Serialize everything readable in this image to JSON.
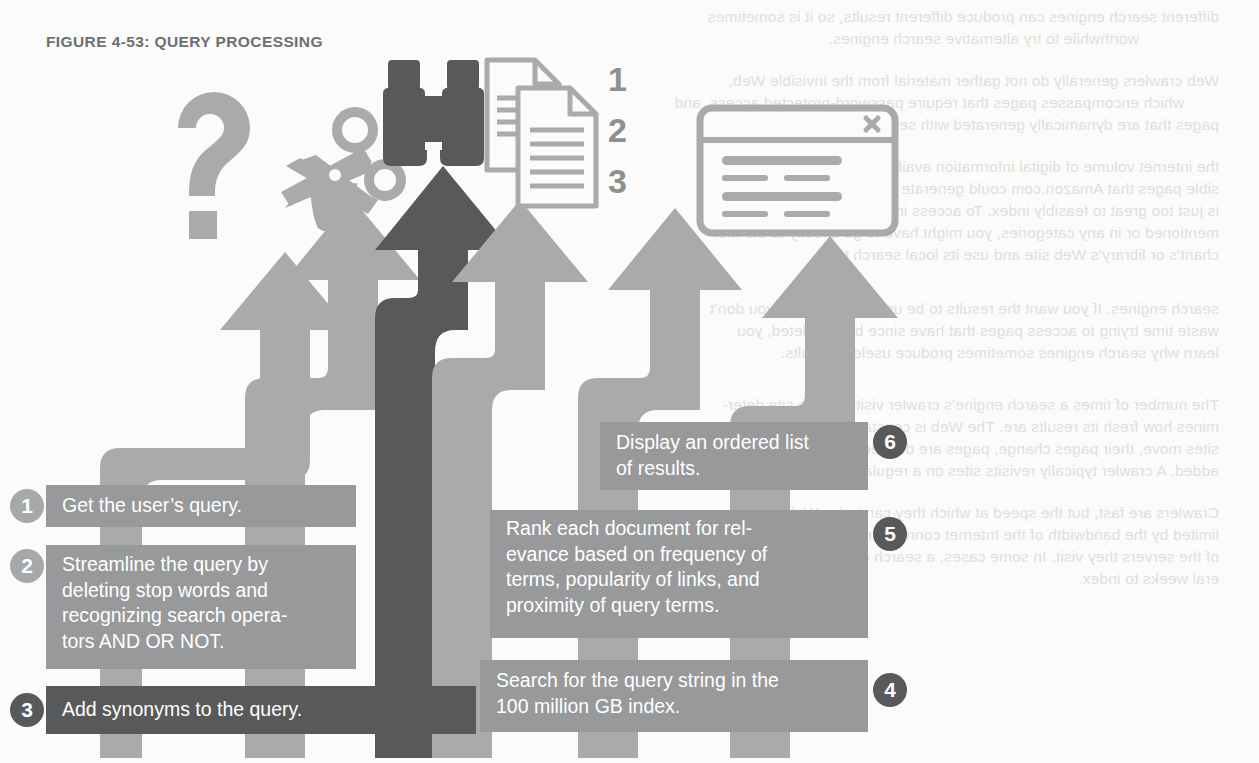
{
  "figure": {
    "title": "FIGURE 4-53: QUERY PROCESSING"
  },
  "colors": {
    "light_gray": "#a9aaac",
    "mid_gray": "#96989a",
    "dark_gray": "#58595b",
    "box_light": "#98999b",
    "box_dark": "#58595b",
    "circle_gray": "#a7a8aa",
    "circle_dark": "#58595b",
    "icon_light": "#a9aaac",
    "icon_dark": "#58595b",
    "text_white": "#ffffff",
    "title_gray": "#6d6f71",
    "page_bg": "#fbfbfa",
    "bleed_text": "#c9c9c7"
  },
  "icons": [
    {
      "name": "question-mark-icon",
      "glyph": "?",
      "label": "question mark",
      "tone": "light"
    },
    {
      "name": "scissors-icon",
      "glyph": "✂",
      "label": "scissors",
      "tone": "light"
    },
    {
      "name": "binoculars-icon",
      "glyph": "🔭",
      "label": "binoculars",
      "tone": "dark"
    },
    {
      "name": "documents-icon",
      "glyph": "📄",
      "label": "stacked documents",
      "tone": "light"
    },
    {
      "name": "browser-window-icon",
      "glyph": "▣",
      "label": "browser results window",
      "tone": "light"
    }
  ],
  "doc_numerals": [
    "1",
    "2",
    "3"
  ],
  "steps": [
    {
      "number": "1",
      "side": "left",
      "tone": "light",
      "text": "Get the user’s query."
    },
    {
      "number": "2",
      "side": "left",
      "tone": "light",
      "text": "Streamline the query by\ndeleting stop words and\nrecognizing search opera-\ntors AND OR NOT."
    },
    {
      "number": "3",
      "side": "left",
      "tone": "dark",
      "text": "Add synonyms to the query."
    },
    {
      "number": "4",
      "side": "right",
      "tone": "light",
      "text": "Search for the query string in the\n100 million GB index."
    },
    {
      "number": "5",
      "side": "right",
      "tone": "light",
      "text": "Rank each document for rel-\nevance based on frequency of\nterms, popularity of links, and\nproximity of query terms."
    },
    {
      "number": "6",
      "side": "right",
      "tone": "light",
      "text": "Display an ordered list\nof results."
    }
  ],
  "bleed_text_lines": [
    {
      "x": 40,
      "y": 8,
      "text": "different search engines can produce different results, so it is sometimes"
    },
    {
      "x": 120,
      "y": 30,
      "text": "worthwhile to try alternative search engines."
    },
    {
      "x": 40,
      "y": 72,
      "text": "Web crawlers generally do not gather material from the invisible Web,"
    },
    {
      "x": 75,
      "y": 94,
      "text": "which encompasses pages that require password-protected access, and"
    },
    {
      "x": 40,
      "y": 116,
      "text": "pages that are dynamically generated with server-side scripts. Also, some"
    },
    {
      "x": 40,
      "y": 158,
      "text": "the internet volume of digital information available, such as all the pos-"
    },
    {
      "x": 40,
      "y": 180,
      "text": "sible pages that Amazon.com could generate from its inventory database,"
    },
    {
      "x": 40,
      "y": 202,
      "text": "is just too great to feasibly index. To access information that is not online"
    },
    {
      "x": 40,
      "y": 224,
      "text": "mentioned or in any categories, you might have to go directly to the mer-"
    },
    {
      "x": 40,
      "y": 246,
      "text": "chant’s or library’s Web site and use its local search tools."
    },
    {
      "x": 40,
      "y": 300,
      "text": "search engines. If you want the results to be up to date so that you don’t"
    },
    {
      "x": 40,
      "y": 322,
      "text": "waste time trying to access pages that have since been deleted, you"
    },
    {
      "x": 40,
      "y": 344,
      "text": "learn why search engines sometimes produce useless results."
    },
    {
      "x": 40,
      "y": 396,
      "text": "The number of times a search engine’s crawler visits a Web site deter-"
    },
    {
      "x": 40,
      "y": 418,
      "text": "mines how fresh its results are. The Web is constantly changing and"
    },
    {
      "x": 40,
      "y": 440,
      "text": "sites move, their pages change, pages are deleted, and new pages are"
    },
    {
      "x": 40,
      "y": 462,
      "text": "added. A crawler typically revisits sites on a regular schedule to update"
    },
    {
      "x": 40,
      "y": 504,
      "text": "Crawlers are fast, but the speed at which they can index Web sites is"
    },
    {
      "x": 40,
      "y": 526,
      "text": "limited by the bandwidth of the Internet connection and the capacity"
    },
    {
      "x": 40,
      "y": 548,
      "text": "of the servers they visit. In some cases, a search engine may take sev-"
    },
    {
      "x": 40,
      "y": 570,
      "text": "eral weeks to index."
    }
  ]
}
